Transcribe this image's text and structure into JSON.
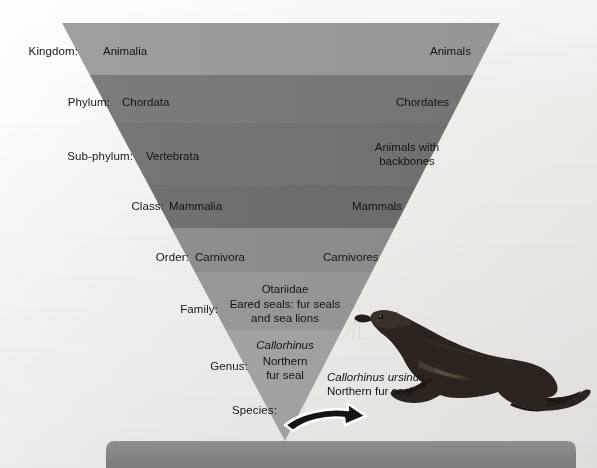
{
  "figure": {
    "background_color": "#f3f2f0"
  },
  "pyramid": {
    "shape": "inverted-triangle",
    "apex_label": "Species",
    "bands": [
      {
        "rank": "Kingdom:",
        "scientific": "Animalia",
        "common": "Animals",
        "color": "#9c9c9c"
      },
      {
        "rank": "Phylum:",
        "scientific": "Chordata",
        "common": "Chordates",
        "color": "#7a7a7a"
      },
      {
        "rank": "Sub-phylum:",
        "scientific": "Vertebrata",
        "common": "Animals with backbones",
        "color": "#757575"
      },
      {
        "rank": "Class:",
        "scientific": "Mammalia",
        "common": "Mammals",
        "color": "#6f6f6f"
      },
      {
        "rank": "Order:",
        "scientific": "Carnivora",
        "common": "Carnivores",
        "color": "#8d8d8d"
      },
      {
        "rank": "Family:",
        "scientific": "Otariidae",
        "common": "Eared seals: fur seals and sea lions",
        "color": "#989898"
      },
      {
        "rank": "Genus:",
        "scientific": "Callorhinus",
        "common": "Northern fur seal",
        "color": "#a3a3a3"
      },
      {
        "rank": "Species:",
        "scientific": "Callorhinus ursinus",
        "common": "Northern fur seal",
        "color": "#aaaaaa"
      }
    ]
  },
  "labels": {
    "kingdom": "Kingdom:",
    "phylum": "Phylum:",
    "subphylum": "Sub-phylum:",
    "class": "Class:",
    "order": "Order:",
    "family": "Family:",
    "genus": "Genus:",
    "species": "Species:"
  },
  "scientific_names": {
    "kingdom": "Animalia",
    "phylum": "Chordata",
    "subphylum": "Vertebrata",
    "class": "Mammalia",
    "order": "Carnivora",
    "family": "Otariidae",
    "genus": "Callorhinus"
  },
  "common_names": {
    "kingdom": "Animals",
    "phylum": "Chordates",
    "subphylum": "Animals with\nbackbones",
    "class": "Mammals",
    "order": "Carnivores",
    "family": "Eared seals: fur seals\nand sea lions",
    "genus": "Northern\nfur seal"
  },
  "species_callout": {
    "scientific": "Callorhinus ursinus",
    "common": "Northern fur seal"
  },
  "illustration": {
    "name": "northern-fur-seal",
    "description": "Dark brown northern fur seal facing left with fore-flippers and hind flippers",
    "color": "#2b231d"
  },
  "arrow": {
    "name": "curved-pointer-arrow",
    "direction": "right",
    "fill": "#141414",
    "outline": "#ffffff"
  },
  "bottom_bar": {
    "color": "#858585"
  }
}
